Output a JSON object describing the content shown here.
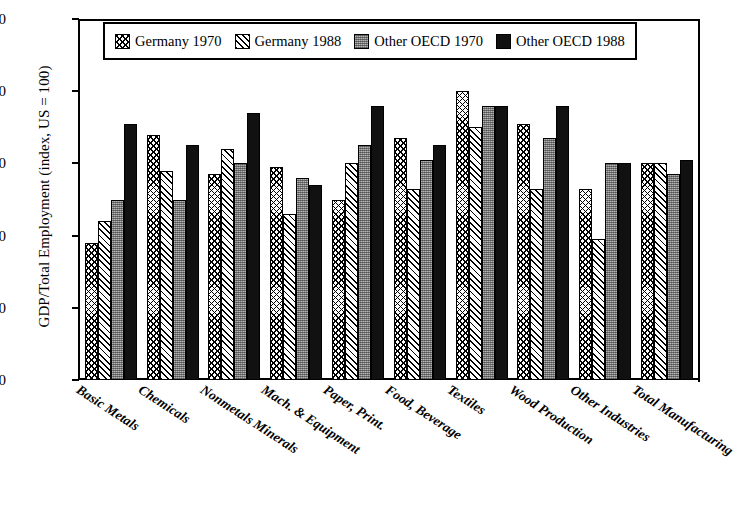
{
  "chart_data": {
    "type": "bar",
    "title": "",
    "xlabel": "",
    "ylabel": "GDP/Total Employment (index, US = 100)",
    "ylim": [
      0,
      100
    ],
    "yticks": [
      0,
      20,
      40,
      60,
      80,
      100
    ],
    "grid": false,
    "legend_position": "top-inside",
    "categories": [
      "Basic Metals",
      "Chemicals",
      "Nonmetals Minerals",
      "Mach. & Equipment",
      "Paper, Print.",
      "Food, Beverage",
      "Textiles",
      "Wood Production",
      "Other Industries",
      "Total Manufacturing"
    ],
    "series": [
      {
        "name": "Germany 1970",
        "pattern": "crosshatch",
        "color": "#ffffff",
        "values": [
          38,
          68,
          57,
          59,
          50,
          67,
          80,
          71,
          53,
          60
        ]
      },
      {
        "name": "Germany 1988",
        "pattern": "diagonal-hatch",
        "color": "#ffffff",
        "values": [
          44,
          58,
          64,
          46,
          60,
          53,
          70,
          53,
          39,
          60
        ]
      },
      {
        "name": "Other OECD 1970",
        "pattern": "stipple-gray",
        "color": "#8d8d8d",
        "values": [
          50,
          50,
          60,
          56,
          65,
          61,
          76,
          67,
          60,
          57
        ]
      },
      {
        "name": "Other OECD 1988",
        "pattern": "solid",
        "color": "#111111",
        "values": [
          71,
          65,
          74,
          54,
          76,
          65,
          76,
          76,
          60,
          61
        ]
      }
    ]
  },
  "legend": {
    "items": [
      {
        "label": "Germany 1970"
      },
      {
        "label": "Germany 1988"
      },
      {
        "label": "Other OECD 1970"
      },
      {
        "label": "Other OECD 1988"
      }
    ]
  }
}
